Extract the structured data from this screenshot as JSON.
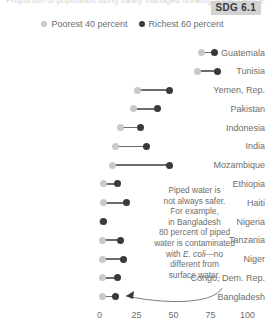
{
  "badge": {
    "label": "SDG 6.1"
  },
  "top_strip": {
    "text": "Proportion of population using safely managed drinking water services"
  },
  "legend": {
    "items": [
      {
        "label": "Poorest 40 percent",
        "color": "#c9c9c9",
        "icon": "circle-marker-icon"
      },
      {
        "label": "Richest 60 percent",
        "color": "#3a3a3a",
        "icon": "circle-marker-icon"
      }
    ]
  },
  "annotation": {
    "lines": [
      "Piped water is",
      "not always safer.",
      "For example,",
      "in Bangladesh",
      "80 percent of piped",
      "water is contaminated",
      "with E. coli—no",
      "different from",
      "surface water."
    ],
    "text": "Piped water is not always safer. For example, in Bangladesh 80 percent of piped water is contaminated with E. coli—no different from surface water."
  },
  "chart_data": {
    "type": "bar",
    "subtype": "dumbbell",
    "title": "",
    "xlabel": "",
    "ylabel": "",
    "xlim": [
      0,
      100
    ],
    "xticks": [
      0,
      25,
      50,
      75,
      100
    ],
    "ticklabels": [
      "0",
      "25",
      "50",
      "75",
      "100"
    ],
    "grid": false,
    "legend_position": "top-center",
    "categories": [
      "Guatemala",
      "Tunisia",
      "Yemen, Rep.",
      "Pakistan",
      "Indonesia",
      "India",
      "Mozambique",
      "Ethiopia",
      "Haiti",
      "Nigeria",
      "Tanzania",
      "Niger",
      "Congo, Dem. Rep.",
      "Bangladesh"
    ],
    "series": [
      {
        "name": "Poorest 40 percent",
        "color": "#c9c9c9",
        "values": [
          69,
          66,
          26,
          23,
          14,
          11,
          9,
          3,
          3,
          2,
          2,
          2,
          2,
          2
        ]
      },
      {
        "name": "Richest 60 percent",
        "color": "#3a3a3a",
        "values": [
          78,
          80,
          47,
          39,
          28,
          32,
          47,
          12,
          18,
          3,
          14,
          16,
          12,
          11
        ]
      }
    ]
  },
  "colors": {
    "poorest": "#c9c9c9",
    "richest": "#3a3a3a",
    "connector": "#6b6b6b",
    "text": "#6e6e6e",
    "badge_bg": "#d2d2d2",
    "badge_text": "#3a3a3a"
  }
}
